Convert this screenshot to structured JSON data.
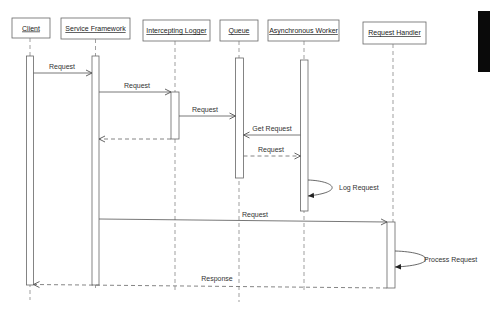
{
  "diagram": {
    "type": "uml-sequence",
    "participants": [
      {
        "id": "client",
        "label": "Client"
      },
      {
        "id": "service_framework",
        "label": "Service Framework"
      },
      {
        "id": "intercepting_logger",
        "label": "Intercepting Logger"
      },
      {
        "id": "queue",
        "label": "Queue"
      },
      {
        "id": "async_worker",
        "label": "Asynchronous Worker"
      },
      {
        "id": "request_handler",
        "label": "Request Handler"
      }
    ],
    "messages": [
      {
        "from": "client",
        "to": "service_framework",
        "label": "Request",
        "style": "solid"
      },
      {
        "from": "service_framework",
        "to": "intercepting_logger",
        "label": "Request",
        "style": "solid"
      },
      {
        "from": "intercepting_logger",
        "to": "queue",
        "label": "Request",
        "style": "solid"
      },
      {
        "from": "intercepting_logger",
        "to": "service_framework",
        "label": "",
        "style": "dashed"
      },
      {
        "from": "async_worker",
        "to": "queue",
        "label": "Get Request",
        "style": "solid"
      },
      {
        "from": "queue",
        "to": "async_worker",
        "label": "Request",
        "style": "dashed"
      },
      {
        "from": "async_worker",
        "to": "async_worker",
        "label": "Log Request",
        "style": "self"
      },
      {
        "from": "service_framework",
        "to": "request_handler",
        "label": "Request",
        "style": "solid"
      },
      {
        "from": "request_handler",
        "to": "request_handler",
        "label": "Process Request",
        "style": "self"
      },
      {
        "from": "request_handler",
        "to": "client",
        "label": "Response",
        "style": "dashed"
      }
    ]
  },
  "colors": {
    "line": "#555555",
    "text": "#333333",
    "background": "#ffffff",
    "edge_bar": "#0a0a0a"
  }
}
